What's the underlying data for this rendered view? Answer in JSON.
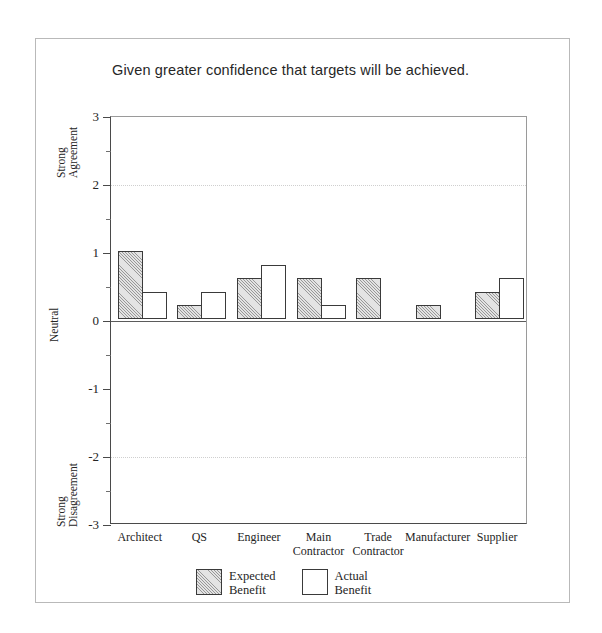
{
  "chart_data": {
    "type": "bar",
    "title": "Given greater confidence that targets will be achieved.",
    "xlabel": "",
    "ylabel": "",
    "ylim": [
      -3,
      3
    ],
    "grid": "dotted horizontal gridlines at 2 and -2",
    "legend_position": "bottom-center",
    "categories": [
      "Architect",
      "QS",
      "Engineer",
      "Main Contractor",
      "Trade Contractor",
      "Manufacturer",
      "Supplier"
    ],
    "category_lines": [
      [
        "Architect"
      ],
      [
        "QS"
      ],
      [
        "Engineer"
      ],
      [
        "Main",
        "Contractor"
      ],
      [
        "Trade",
        "Contractor"
      ],
      [
        "Manufacturer"
      ],
      [
        "Supplier"
      ]
    ],
    "series": [
      {
        "name": "Expected Benefit",
        "name_lines": [
          "Expected",
          "Benefit"
        ],
        "fill": "hatched",
        "values": [
          1.0,
          0.2,
          0.6,
          0.6,
          0.6,
          0.2,
          0.4
        ]
      },
      {
        "name": "Actual Benefit",
        "name_lines": [
          "Actual",
          "Benefit"
        ],
        "fill": "white",
        "values": [
          0.4,
          0.4,
          0.8,
          0.2,
          0,
          0,
          0.6
        ]
      }
    ],
    "y_major_ticks": [
      3,
      2,
      1,
      0,
      -1,
      -2,
      -3
    ],
    "y_tick_labels": [
      "3",
      "2",
      "1",
      "0",
      "-1",
      "-2",
      "-3"
    ],
    "y_minor_ticks": [
      2.5,
      1.5,
      0.5,
      -0.5,
      -1.5,
      -2.5
    ],
    "y_gridlines": [
      2,
      -2
    ],
    "y_scale_anchors": [
      {
        "value": 2.5,
        "lines": [
          "Strong",
          "Agreement"
        ]
      },
      {
        "value": 0,
        "lines": [
          "Neutral"
        ]
      },
      {
        "value": -2.5,
        "lines": [
          "Strong",
          "Disagreement"
        ]
      }
    ]
  },
  "colors": {
    "axis": "#4a4a4a",
    "bar_outline": "#3a3a3a",
    "hatch_fill": "#e3e3e3",
    "gridline": "#cfcfcf",
    "page_border": "#b9b9b9",
    "text": "#252525"
  }
}
